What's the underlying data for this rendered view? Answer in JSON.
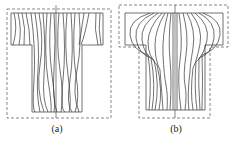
{
  "panels": [
    {
      "id": "a",
      "label": "(a)",
      "description": "T-shaped section with mostly vertical flow lines, dashed rectangular boundary"
    },
    {
      "id": "b",
      "label": "(b)",
      "description": "T-shaped section with flaring flow lines in the flange, dashed T-shaped boundary"
    }
  ],
  "colors": {
    "line": "#333333",
    "dash": "#555555",
    "background": "#ffffff"
  }
}
